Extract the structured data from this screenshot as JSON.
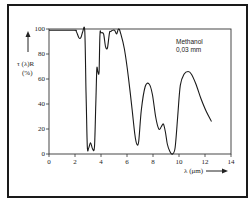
{
  "chart_data": {
    "type": "line",
    "title": "",
    "annotation": [
      "Methanol",
      "0,03 mm"
    ],
    "xlabel": "λ (μm)",
    "ylabel": [
      "τ (λ)R",
      "(%)"
    ],
    "xlim": [
      0,
      14
    ],
    "ylim": [
      0,
      100
    ],
    "xticks": [
      0,
      2,
      4,
      6,
      8,
      10,
      12,
      14
    ],
    "yticks": [
      0,
      20,
      40,
      60,
      80,
      100
    ],
    "grid": false,
    "legend": "none",
    "series": [
      {
        "name": "Methanol 0,03 mm",
        "x": [
          0,
          1.9,
          2.1,
          2.3,
          2.45,
          2.6,
          2.75,
          2.85,
          2.95,
          3.05,
          3.2,
          3.35,
          3.5,
          3.6,
          3.68,
          3.75,
          3.85,
          3.92,
          4.0,
          4.2,
          4.35,
          4.5,
          4.65,
          4.75,
          4.9,
          5.05,
          5.2,
          5.35,
          5.5,
          5.8,
          6.1,
          6.4,
          6.6,
          6.75,
          6.9,
          7.1,
          7.4,
          7.7,
          7.95,
          8.2,
          8.45,
          8.65,
          8.8,
          8.95,
          9.1,
          9.3,
          9.5,
          9.7,
          9.9,
          10.1,
          10.4,
          10.7,
          10.95,
          11.3,
          11.7,
          12.1,
          12.5
        ],
        "y": [
          99,
          99,
          98,
          93,
          93,
          98,
          98,
          50,
          6,
          5,
          9,
          4,
          6,
          40,
          68,
          66,
          66,
          96,
          97,
          96,
          86,
          85,
          97,
          98,
          99,
          99,
          96,
          100,
          97,
          84,
          62,
          35,
          16,
          8,
          10,
          35,
          54,
          56,
          48,
          30,
          20,
          22,
          24,
          18,
          8,
          2,
          0,
          5,
          30,
          55,
          64,
          66,
          64,
          56,
          44,
          34,
          26
        ]
      }
    ]
  },
  "plot_px": {
    "x0": 49,
    "x1": 231,
    "y0": 154,
    "y1": 29
  },
  "colors": {
    "line": "#1a1a1a",
    "frame": "#1a1a1a",
    "axis": "#333333"
  }
}
